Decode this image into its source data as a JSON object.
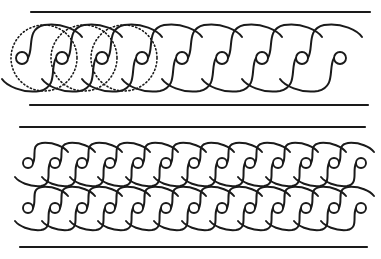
{
  "figure": {
    "width": 381,
    "height": 259,
    "ink_color": "#1a1a1a",
    "background": "#ffffff"
  },
  "top_band": {
    "name": "single guilloche band with construction circles",
    "rules": [
      {
        "x1": 31,
        "x2": 370,
        "y": 12
      },
      {
        "x1": 30,
        "x2": 368,
        "y": 105
      }
    ],
    "center_y": 58,
    "strand_radius": 33,
    "eye_radius": 6,
    "construction_circles": [
      {
        "cx": 44,
        "cy": 58,
        "r": 33
      },
      {
        "cx": 84,
        "cy": 58,
        "r": 33
      },
      {
        "cx": 124,
        "cy": 58,
        "r": 33
      }
    ],
    "loop_centers_x": [
      62,
      102,
      142,
      182,
      222,
      262,
      302,
      342
    ],
    "eyes_x": [
      22,
      62,
      102,
      142,
      182,
      222,
      262,
      302,
      340
    ]
  },
  "bottom_band": {
    "name": "double interlaced guilloche band",
    "rules": [
      {
        "x1": 20,
        "x2": 365,
        "y": 127
      },
      {
        "x1": 20,
        "x2": 367,
        "y": 247
      }
    ],
    "rows": [
      {
        "center_y": 163,
        "top_y": 143,
        "bottom_y": 186
      },
      {
        "center_y": 208,
        "top_y": 187,
        "bottom_y": 230
      }
    ],
    "eye_radius": 5,
    "eyes_x": [
      28,
      55,
      82,
      110,
      138,
      166,
      194,
      222,
      250,
      278,
      306,
      334,
      361
    ]
  }
}
